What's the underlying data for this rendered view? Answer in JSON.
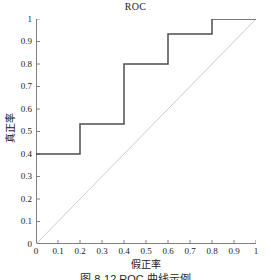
{
  "chart_data": {
    "type": "line",
    "title": "ROC",
    "xlabel": "假正率",
    "ylabel": "真正率",
    "xlim": [
      0,
      1
    ],
    "ylim": [
      0,
      1
    ],
    "grid": false,
    "legend": "none",
    "x_ticks": [
      "0",
      "0.1",
      "0.2",
      "0.3",
      "0.4",
      "0.5",
      "0.6",
      "0.7",
      "0.8",
      "0.9",
      "1"
    ],
    "y_ticks": [
      "0",
      "0.1",
      "0.2",
      "0.3",
      "0.4",
      "0.5",
      "0.6",
      "0.7",
      "0.8",
      "0.9",
      "1"
    ],
    "x_tick_values": [
      0,
      0.1,
      0.2,
      0.3,
      0.4,
      0.5,
      0.6,
      0.7,
      0.8,
      0.9,
      1
    ],
    "y_tick_values": [
      0,
      0.1,
      0.2,
      0.3,
      0.4,
      0.5,
      0.6,
      0.7,
      0.8,
      0.9,
      1
    ],
    "series": [
      {
        "name": "ROC curve",
        "style": "step-post",
        "color": "#4d4d4d",
        "width": 1.5,
        "x": [
          0,
          0.2,
          0.2,
          0.4,
          0.4,
          0.6,
          0.6,
          0.8,
          0.8,
          1
        ],
        "y": [
          0.4,
          0.4,
          0.533,
          0.533,
          0.8,
          0.8,
          0.933,
          0.933,
          1,
          1
        ],
        "points": [
          {
            "x": 0,
            "y": 0.4
          },
          {
            "x": 0.2,
            "y": 0.4
          },
          {
            "x": 0.2,
            "y": 0.533
          },
          {
            "x": 0.4,
            "y": 0.533
          },
          {
            "x": 0.4,
            "y": 0.8
          },
          {
            "x": 0.6,
            "y": 0.8
          },
          {
            "x": 0.6,
            "y": 0.933
          },
          {
            "x": 0.8,
            "y": 0.933
          },
          {
            "x": 0.8,
            "y": 1
          },
          {
            "x": 1,
            "y": 1
          }
        ]
      },
      {
        "name": "chance diagonal",
        "style": "line",
        "color": "#cccccc",
        "width": 1,
        "x": [
          0,
          1
        ],
        "y": [
          0,
          1
        ],
        "points": [
          {
            "x": 0,
            "y": 0
          },
          {
            "x": 1,
            "y": 1
          }
        ]
      }
    ],
    "axis_color": "#808080",
    "background": "#ffffff"
  },
  "caption": {
    "text": "图 8-12  ROC 曲线示例"
  }
}
